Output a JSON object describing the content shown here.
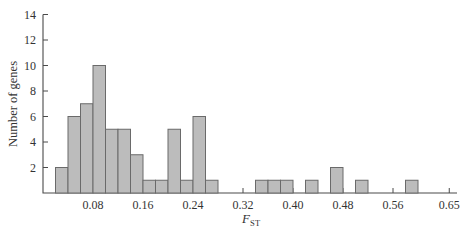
{
  "chart_data": {
    "type": "bar",
    "subtype": "histogram",
    "title": "",
    "ylabel": "Number of genes",
    "xlabel": {
      "variable": "F",
      "subscript": "ST"
    },
    "ylim": [
      0,
      14
    ],
    "xlim": [
      0,
      0.66
    ],
    "grid": false,
    "legend": "none",
    "bin_width": 0.02,
    "bins": [
      {
        "start": 0.02,
        "count": 2
      },
      {
        "start": 0.04,
        "count": 6
      },
      {
        "start": 0.06,
        "count": 7
      },
      {
        "start": 0.08,
        "count": 10
      },
      {
        "start": 0.1,
        "count": 5
      },
      {
        "start": 0.12,
        "count": 5
      },
      {
        "start": 0.14,
        "count": 3
      },
      {
        "start": 0.16,
        "count": 1
      },
      {
        "start": 0.18,
        "count": 1
      },
      {
        "start": 0.2,
        "count": 5
      },
      {
        "start": 0.22,
        "count": 1
      },
      {
        "start": 0.24,
        "count": 6
      },
      {
        "start": 0.26,
        "count": 1
      },
      {
        "start": 0.34,
        "count": 1
      },
      {
        "start": 0.36,
        "count": 1
      },
      {
        "start": 0.38,
        "count": 1
      },
      {
        "start": 0.42,
        "count": 1
      },
      {
        "start": 0.46,
        "count": 2
      },
      {
        "start": 0.5,
        "count": 1
      },
      {
        "start": 0.58,
        "count": 1
      }
    ],
    "x_ticks": [
      {
        "value": 0.08,
        "label": "0.08"
      },
      {
        "value": 0.16,
        "label": "0.16"
      },
      {
        "value": 0.24,
        "label": "0.24"
      },
      {
        "value": 0.32,
        "label": "0.32"
      },
      {
        "value": 0.4,
        "label": "0.40"
      },
      {
        "value": 0.48,
        "label": "0.48"
      },
      {
        "value": 0.56,
        "label": "0.56"
      },
      {
        "value": 0.65,
        "label": "0.65"
      }
    ],
    "y_ticks": [
      {
        "value": 2,
        "label": "2"
      },
      {
        "value": 4,
        "label": "4"
      },
      {
        "value": 6,
        "label": "6"
      },
      {
        "value": 8,
        "label": "8"
      },
      {
        "value": 10,
        "label": "10"
      },
      {
        "value": 12,
        "label": "12"
      },
      {
        "value": 14,
        "label": "14"
      }
    ],
    "colors": {
      "bar_fill": "#bcbcbc",
      "bar_stroke": "#6a6a6a",
      "axis": "#4a4a4a",
      "text": "#333333",
      "background": "#ffffff"
    }
  }
}
